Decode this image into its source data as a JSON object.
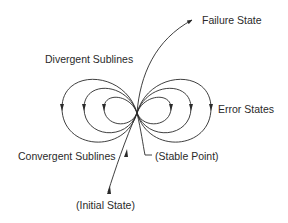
{
  "diagram": {
    "labels": {
      "failure_state": "Failure State",
      "divergent_sublines": "Divergent Sublines",
      "error_states": "Error States",
      "convergent_sublines": "Convergent Sublines",
      "stable_point": "(Stable Point)",
      "initial_state": "(Initial State)"
    },
    "stroke_color": "#2a2a2a",
    "background": "#ffffff"
  }
}
